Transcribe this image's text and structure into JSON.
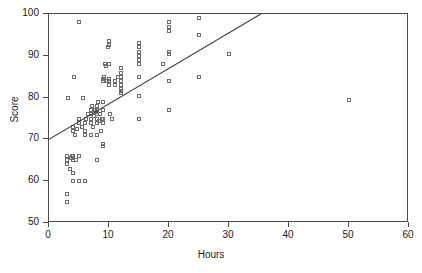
{
  "figure": {
    "title": "",
    "title_clipped": true
  },
  "axes": {
    "xlabel": "Hours",
    "ylabel": "Score",
    "xticks": [
      "0",
      "10",
      "20",
      "30",
      "40",
      "50",
      "60"
    ],
    "yticks": [
      "50",
      "60",
      "70",
      "80",
      "90",
      "100"
    ]
  },
  "colors": {
    "marker_outline": "#6e6e6e",
    "axis": "#4a4a4a",
    "fit_line": "#3a3a3a",
    "background": "#ffffff"
  },
  "chart_data": {
    "type": "scatter",
    "title": "",
    "xlabel": "Hours",
    "ylabel": "Score",
    "xlim": [
      0,
      60
    ],
    "ylim": [
      50,
      100
    ],
    "xticks": [
      0,
      10,
      20,
      30,
      40,
      50,
      60
    ],
    "yticks": [
      50,
      60,
      70,
      80,
      90,
      100
    ],
    "grid": false,
    "legend": null,
    "marker": "open-square",
    "series": [
      {
        "name": "observations",
        "points": [
          [
            3,
            55
          ],
          [
            3,
            57
          ],
          [
            3,
            65
          ],
          [
            3,
            64
          ],
          [
            3,
            66
          ],
          [
            3.2,
            80
          ],
          [
            3.5,
            63
          ],
          [
            3.6,
            65.5
          ],
          [
            3.8,
            66
          ],
          [
            4,
            60
          ],
          [
            4,
            62
          ],
          [
            4,
            65
          ],
          [
            4,
            65.5
          ],
          [
            4,
            66
          ],
          [
            4,
            72
          ],
          [
            4,
            73
          ],
          [
            4.2,
            85
          ],
          [
            4.4,
            71
          ],
          [
            4.5,
            65
          ],
          [
            4.6,
            72.5
          ],
          [
            5,
            60
          ],
          [
            5,
            66
          ],
          [
            5,
            75
          ],
          [
            5,
            74
          ],
          [
            5,
            98
          ],
          [
            5.5,
            73
          ],
          [
            5.6,
            80
          ],
          [
            6,
            60
          ],
          [
            6,
            71
          ],
          [
            6,
            72
          ],
          [
            6,
            74
          ],
          [
            6.2,
            75
          ],
          [
            6.5,
            76
          ],
          [
            7,
            71
          ],
          [
            7,
            74
          ],
          [
            7,
            75
          ],
          [
            7,
            76
          ],
          [
            7,
            77
          ],
          [
            7.2,
            78
          ],
          [
            7.4,
            73
          ],
          [
            7.5,
            75.5
          ],
          [
            7.6,
            77
          ],
          [
            7.8,
            76.5
          ],
          [
            8,
            65
          ],
          [
            8,
            71
          ],
          [
            8,
            74
          ],
          [
            8,
            75
          ],
          [
            8,
            76
          ],
          [
            8,
            77
          ],
          [
            8,
            78
          ],
          [
            8.2,
            79
          ],
          [
            8.4,
            74.5
          ],
          [
            8.5,
            76
          ],
          [
            8.6,
            72
          ],
          [
            8.8,
            75
          ],
          [
            9,
            68.5
          ],
          [
            9,
            69
          ],
          [
            9,
            74
          ],
          [
            9,
            75
          ],
          [
            9,
            77
          ],
          [
            9,
            79
          ],
          [
            9,
            84
          ],
          [
            9,
            84.5
          ],
          [
            9.2,
            85
          ],
          [
            9.4,
            88
          ],
          [
            9.5,
            87.5
          ],
          [
            9.6,
            84
          ],
          [
            9.8,
            92
          ],
          [
            10,
            83
          ],
          [
            10,
            84
          ],
          [
            10,
            84.5
          ],
          [
            10,
            88
          ],
          [
            10,
            92.5
          ],
          [
            10,
            93.5
          ],
          [
            10.2,
            76
          ],
          [
            10.5,
            75
          ],
          [
            11,
            83
          ],
          [
            11,
            84
          ],
          [
            11.5,
            85
          ],
          [
            12,
            81
          ],
          [
            12,
            81.5
          ],
          [
            12,
            82
          ],
          [
            12,
            83
          ],
          [
            12,
            84
          ],
          [
            12,
            85
          ],
          [
            12,
            86
          ],
          [
            12,
            87
          ],
          [
            15,
            75
          ],
          [
            15,
            80.5
          ],
          [
            15,
            85
          ],
          [
            15,
            88
          ],
          [
            15,
            89
          ],
          [
            15,
            90
          ],
          [
            15,
            91
          ],
          [
            15,
            92
          ],
          [
            15,
            93
          ],
          [
            19,
            88
          ],
          [
            20,
            77
          ],
          [
            20,
            84
          ],
          [
            20,
            90.5
          ],
          [
            20,
            91
          ],
          [
            20,
            96
          ],
          [
            20,
            97
          ],
          [
            20,
            98
          ],
          [
            25,
            85
          ],
          [
            25,
            95
          ],
          [
            25,
            99
          ],
          [
            30,
            90.5
          ],
          [
            50,
            79.5
          ]
        ]
      }
    ],
    "fit_line": {
      "type": "linear",
      "intercept": 70,
      "slope": 0.85,
      "x_start": 0,
      "y_start": 70,
      "x_end": 35.3,
      "y_end": 100,
      "note": "regression line exits top of plot area at score 100"
    }
  }
}
